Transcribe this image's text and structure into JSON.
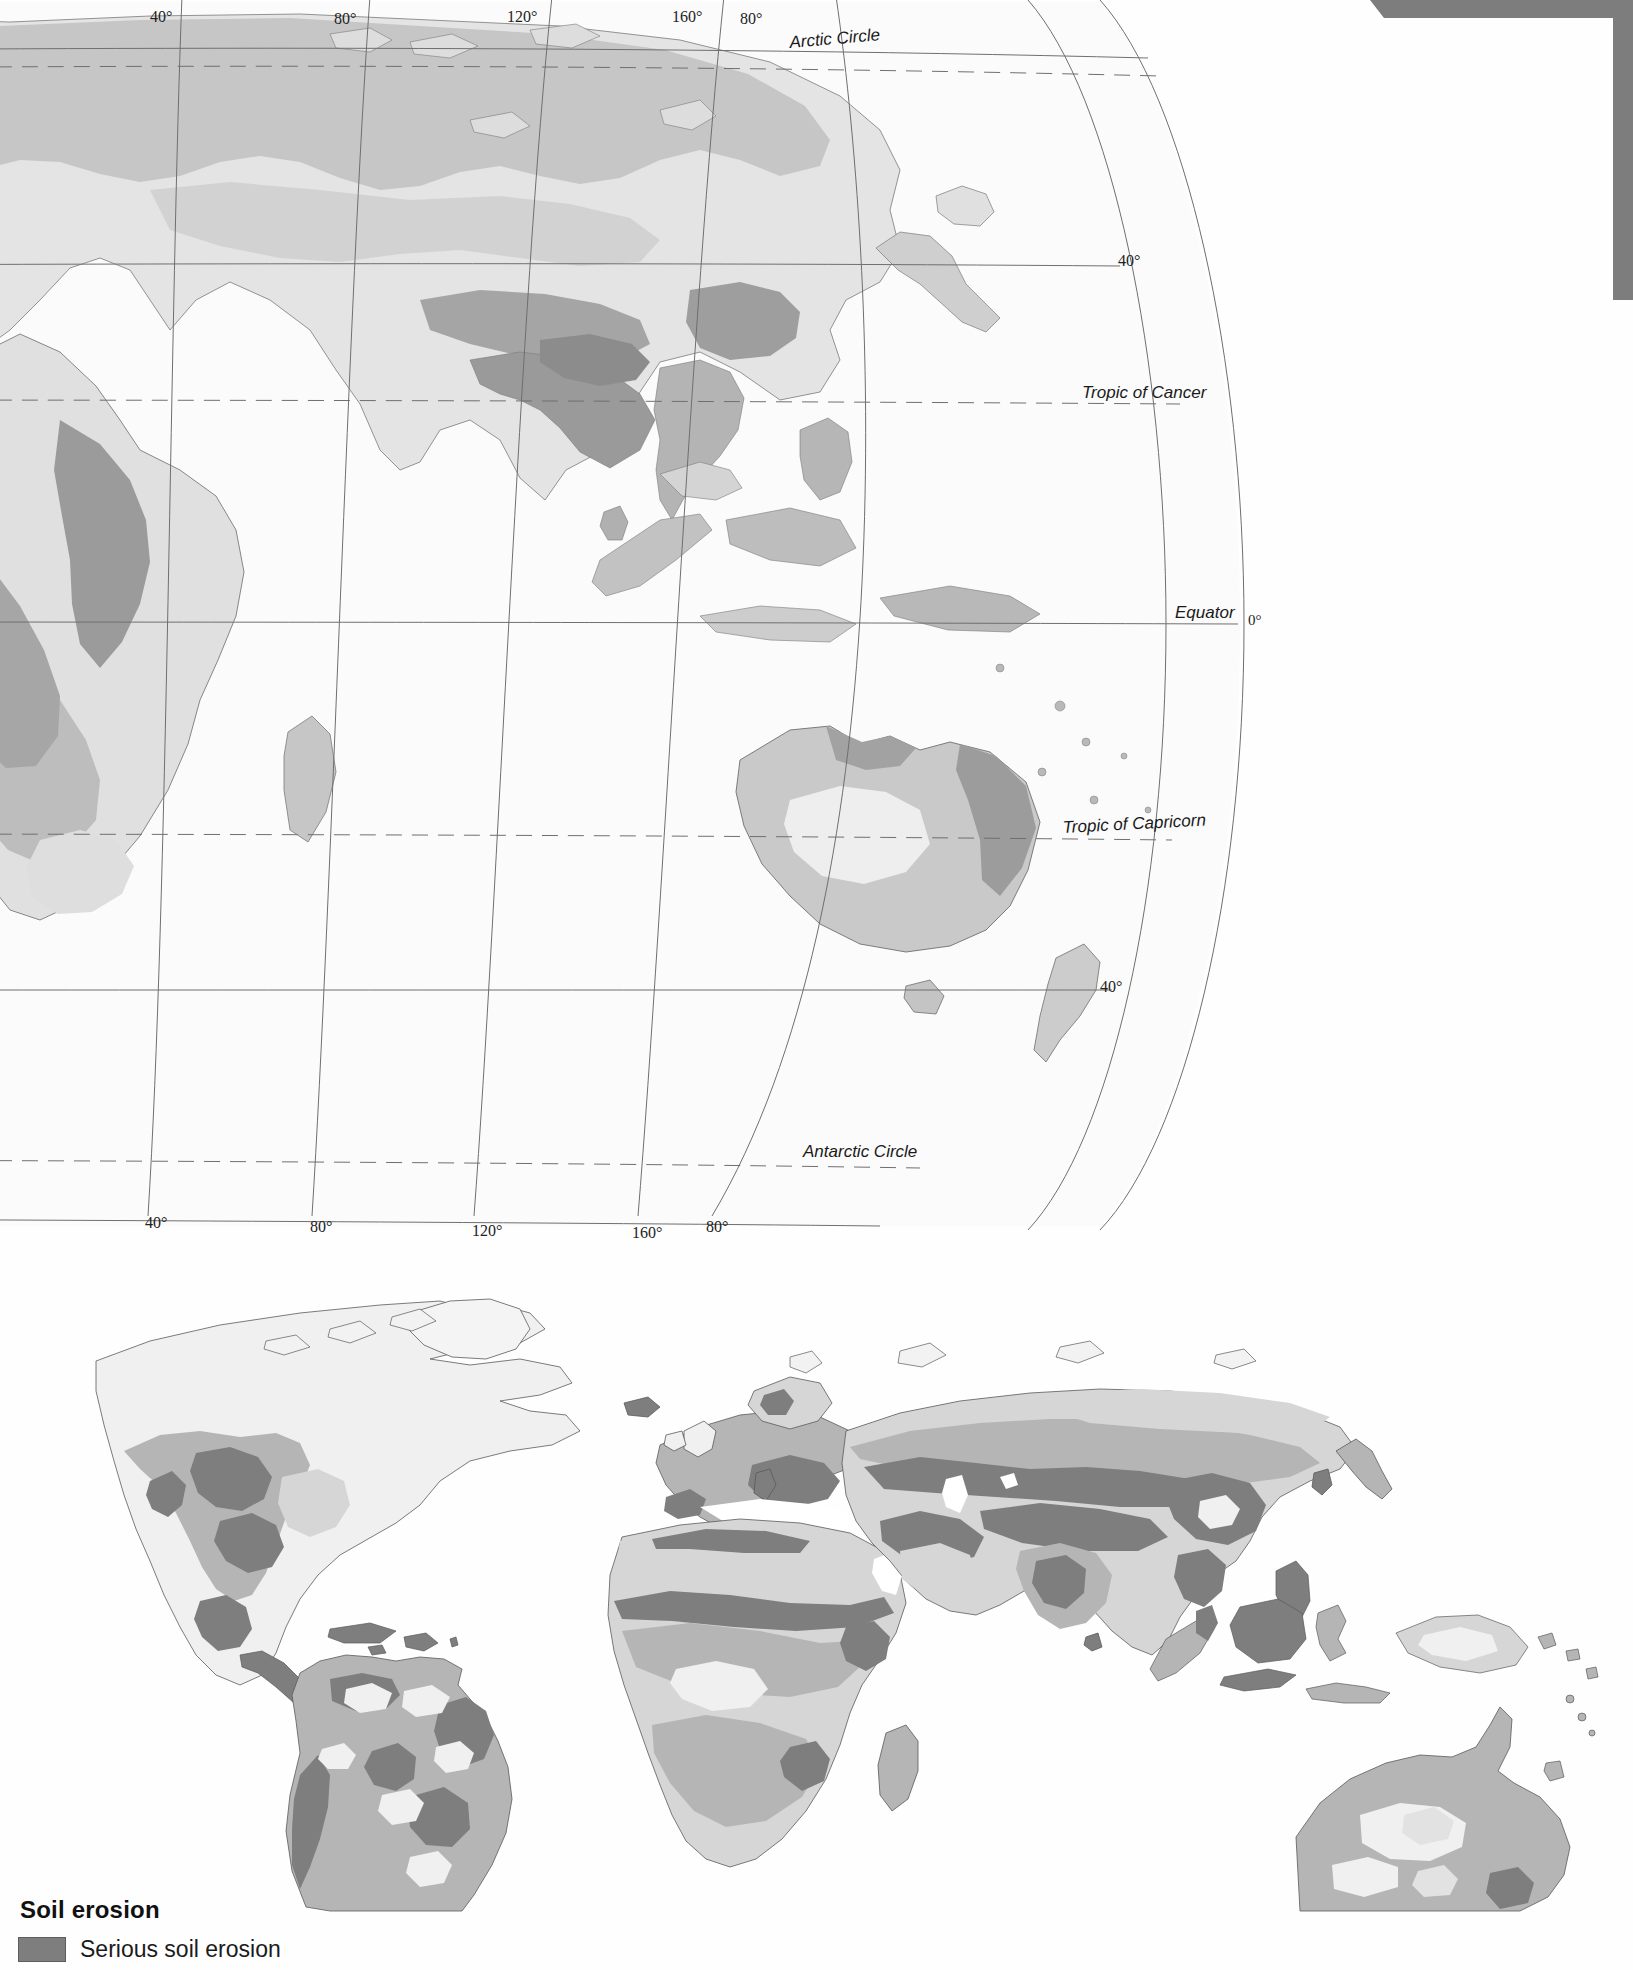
{
  "page": {
    "background_color": "#fefefe",
    "corner_decoration_color": "#7d7d7d"
  },
  "upper_map": {
    "name": "world-population-density-map",
    "projection": "interrupted oval (eastern hemisphere section)",
    "ocean_color": "#fbfbfb",
    "graticule_color": "#6f6f6f",
    "latitude_labels": [
      {
        "text": "Arctic Circle",
        "style": "dashed",
        "x": 790,
        "y": 48
      },
      {
        "text": "40°",
        "x": 1118,
        "y": 266
      },
      {
        "text": "Tropic of Cancer",
        "style": "dashed",
        "x": 1082,
        "y": 398
      },
      {
        "text": "Equator",
        "x": 1175,
        "y": 618
      },
      {
        "text": "0°",
        "x": 1248,
        "y": 623
      },
      {
        "text": "Tropic of Capricorn",
        "style": "dashed",
        "x": 1063,
        "y": 833
      },
      {
        "text": "40°",
        "x": 1100,
        "y": 989
      },
      {
        "text": "Antarctic Circle",
        "style": "dashed",
        "x": 803,
        "y": 1157
      }
    ],
    "longitude_labels_top": [
      {
        "text": "40°",
        "x": 150
      },
      {
        "text": "80°",
        "x": 334
      },
      {
        "text": "120°",
        "x": 507
      },
      {
        "text": "160°",
        "x": 670
      },
      {
        "text": "80°",
        "x": 735
      }
    ],
    "longitude_labels_bottom": [
      {
        "text": "40°",
        "x": 145
      },
      {
        "text": "80°",
        "x": 310
      },
      {
        "text": "120°",
        "x": 472
      },
      {
        "text": "160°",
        "x": 635
      },
      {
        "text": "80°",
        "x": 705
      }
    ],
    "shading_classes": [
      {
        "name": "very-light",
        "color": "#f2f2f2"
      },
      {
        "name": "light",
        "color": "#e2e2e2"
      },
      {
        "name": "medium-light",
        "color": "#cfcfcf"
      },
      {
        "name": "medium",
        "color": "#bcbcbc"
      },
      {
        "name": "medium-dark",
        "color": "#a8a8a8"
      },
      {
        "name": "dark",
        "color": "#949494"
      }
    ]
  },
  "lower_map": {
    "name": "soil-erosion-world-map",
    "projection": "oval / Mollweide-like world",
    "ocean_color": "#ffffff",
    "outline_color": "#5a5a5a",
    "shading_classes": [
      {
        "name": "serious-soil-erosion",
        "color": "#7e7e7e"
      },
      {
        "name": "moderate-soil-erosion",
        "color": "#b5b5b5"
      },
      {
        "name": "slight-soil-erosion",
        "color": "#d6d6d6"
      },
      {
        "name": "stable-or-non-vegetated",
        "color": "#f0f0f0"
      }
    ]
  },
  "legend": {
    "title": "Soil erosion",
    "items": [
      {
        "label": "Serious soil erosion",
        "color": "#7e7e7e"
      }
    ]
  }
}
